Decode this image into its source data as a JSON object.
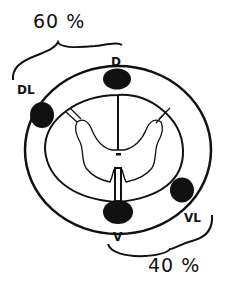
{
  "diagram": {
    "percent_top": "60 %",
    "percent_bottom": "40 %",
    "labels": {
      "dorsal": "D",
      "dorsolateral": "DL",
      "ventral": "V",
      "ventrolateral": "VL"
    },
    "colors": {
      "ink": "#111111",
      "background": "#ffffff"
    }
  }
}
